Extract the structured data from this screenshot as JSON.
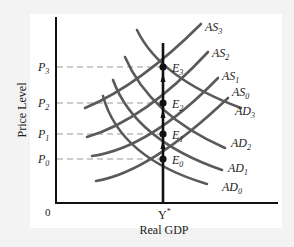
{
  "diagram": {
    "title": "",
    "xlabel": "Real GDP",
    "ylabel": "Price Level",
    "origin_label": "0",
    "potential_output_label": "Y",
    "potential_output_sup": "*",
    "price_levels": [
      {
        "base": "P",
        "sub": "0"
      },
      {
        "base": "P",
        "sub": "1"
      },
      {
        "base": "P",
        "sub": "2"
      },
      {
        "base": "P",
        "sub": "3"
      }
    ],
    "equilibria": [
      {
        "base": "E",
        "sub": "0"
      },
      {
        "base": "E",
        "sub": "1"
      },
      {
        "base": "E",
        "sub": "2"
      },
      {
        "base": "E",
        "sub": "3"
      }
    ],
    "as_curves": [
      {
        "base": "AS",
        "sub": "0"
      },
      {
        "base": "AS",
        "sub": "1"
      },
      {
        "base": "AS",
        "sub": "2"
      },
      {
        "base": "AS",
        "sub": "3"
      }
    ],
    "ad_curves": [
      {
        "base": "AD",
        "sub": "0"
      },
      {
        "base": "AD",
        "sub": "1"
      },
      {
        "base": "AD",
        "sub": "2"
      },
      {
        "base": "AD",
        "sub": "3"
      }
    ],
    "colors": {
      "curve": "#5a5a5a",
      "axis": "#111111",
      "dashed": "#9a9a9a",
      "background": "#f3f3f3",
      "panel": "#ffffff"
    }
  }
}
